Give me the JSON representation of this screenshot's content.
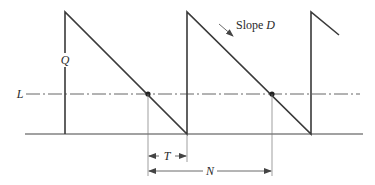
{
  "diagram": {
    "type": "inventory sawtooth (reorder point model)",
    "labels": {
      "quantity": "Q",
      "reorder_level": "L",
      "slope_prefix": "Slope ",
      "slope_var": "D",
      "lead_time": "T",
      "cycle": "N"
    },
    "colors": {
      "line": "#3a3a3a",
      "thin": "#555555",
      "background": "#ffffff"
    }
  }
}
